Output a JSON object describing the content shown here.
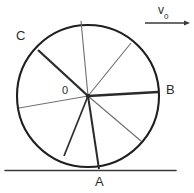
{
  "figure": {
    "type": "physics-diagram",
    "colors": {
      "ink": "#2b2b2b",
      "rim": "#1f1f1f",
      "spoke_dark": "#2b2b2b",
      "spoke_light": "#6e6e6e",
      "ground": "#3a3a3a",
      "background": "#ffffff"
    },
    "labels": {
      "point_a": "A",
      "point_b": "B",
      "point_c": "C",
      "center": "0",
      "velocity": "v",
      "velocity_subscript": "0"
    },
    "geometry": {
      "circle_center_x": 88,
      "circle_center_y": 96,
      "circle_radius": 71,
      "ground_y": 170,
      "ground_x_start": 5,
      "ground_x_end": 176,
      "arrow_y": 23,
      "arrow_x_start": 145,
      "arrow_x_end": 190,
      "spokes": [
        {
          "name": "spoke-to-top",
          "x": 81,
          "y": 21,
          "weight": "light"
        },
        {
          "name": "spoke-to-upper-right",
          "x": 131,
          "y": 43,
          "weight": "light"
        },
        {
          "name": "spoke-to-b",
          "x": 158,
          "y": 92,
          "weight": "dark"
        },
        {
          "name": "spoke-to-lower-right",
          "x": 141,
          "y": 141,
          "weight": "light"
        },
        {
          "name": "spoke-to-a",
          "x": 99,
          "y": 169,
          "weight": "dark"
        },
        {
          "name": "spoke-to-lower-left",
          "x": 64,
          "y": 156,
          "weight": "dark"
        },
        {
          "name": "spoke-to-left",
          "x": 19,
          "y": 108,
          "weight": "light"
        },
        {
          "name": "spoke-to-c",
          "x": 38,
          "y": 50,
          "weight": "dark"
        }
      ]
    },
    "label_positions": {
      "point_c": {
        "x": 18,
        "y": 30
      },
      "point_b": {
        "x": 166,
        "y": 84
      },
      "point_a": {
        "x": 94,
        "y": 175
      },
      "center": {
        "x": 62,
        "y": 85
      },
      "velocity": {
        "x": 157,
        "y": 5
      }
    }
  }
}
